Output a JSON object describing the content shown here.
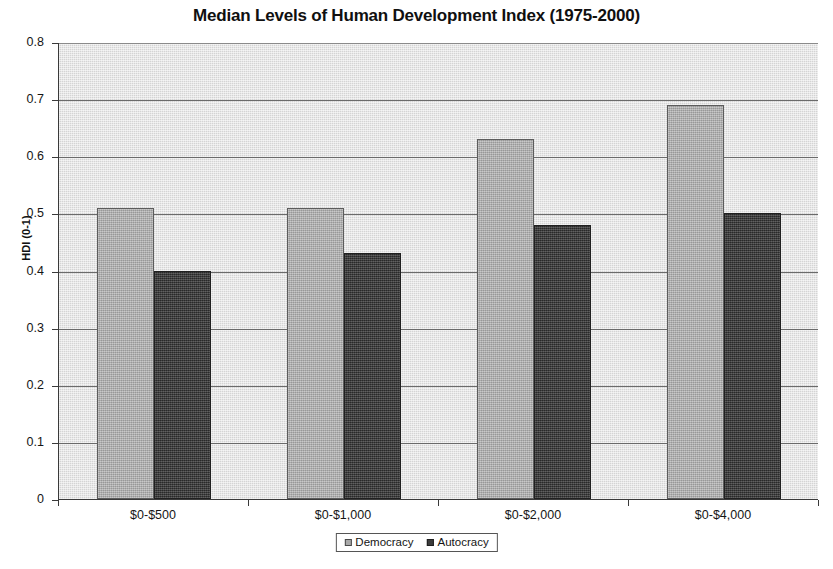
{
  "chart_data": {
    "type": "bar",
    "title": "Median Levels of Human Development Index (1975-2000)",
    "xlabel": "",
    "ylabel": "HDI (0-1)",
    "categories": [
      "$0-$500",
      "$0-$1,000",
      "$0-$2,000",
      "$0-$4,000"
    ],
    "series": [
      {
        "name": "Democracy",
        "values": [
          0.51,
          0.51,
          0.63,
          0.69
        ],
        "color": "#a9a9a9"
      },
      {
        "name": "Autocracy",
        "values": [
          0.4,
          0.43,
          0.48,
          0.5
        ],
        "color": "#3b3b3b"
      }
    ],
    "ylim": [
      0,
      0.8
    ],
    "ytick_labels": [
      "0.8",
      "0.7",
      "0.6",
      "0.5",
      "0.4",
      "0.3",
      "0.2",
      "0.1",
      "0"
    ],
    "ytick_values": [
      0.8,
      0.7,
      0.6,
      0.5,
      0.4,
      0.3,
      0.2,
      0.1,
      0
    ],
    "grid": "horizontal",
    "legend_position": "bottom-center",
    "plot_background": "#d4d4d4"
  },
  "legend": {
    "items": [
      {
        "label": "Democracy"
      },
      {
        "label": "Autocracy"
      }
    ]
  }
}
